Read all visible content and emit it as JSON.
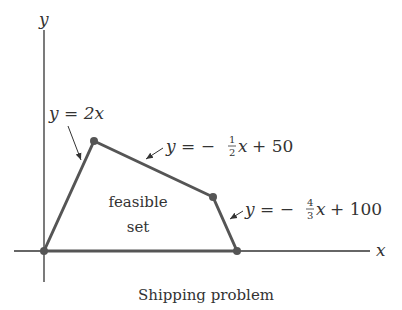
{
  "figure": {
    "caption": "Shipping problem",
    "region_label_line1": "feasible",
    "region_label_line2": "set",
    "axes": {
      "x_label": "x",
      "y_label": "y"
    },
    "constraints": [
      {
        "lhs": "y",
        "eq": "=",
        "rhs": "2x"
      },
      {
        "lhs": "y",
        "eq": "=",
        "sign": "−",
        "num": "1",
        "den": "2",
        "var": "x",
        "rest": "+ 50"
      },
      {
        "lhs": "y",
        "eq": "=",
        "sign": "−",
        "num": "4",
        "den": "3",
        "var": "x",
        "rest": "+ 100"
      }
    ],
    "colors": {
      "line": "#555555",
      "axis": "#333333",
      "vertex": "#555555"
    },
    "vertices": [
      [
        0,
        0
      ],
      [
        20,
        40
      ],
      [
        60,
        20
      ],
      [
        75,
        0
      ]
    ]
  }
}
